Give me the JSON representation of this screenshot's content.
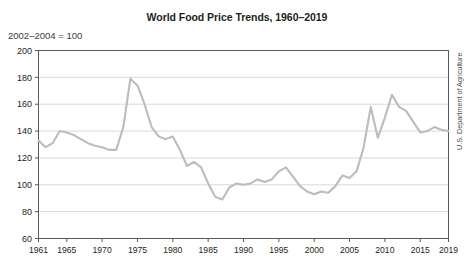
{
  "chart_data": {
    "type": "line",
    "title": "World Food Price Trends, 1960–2019",
    "subtitle": "2002–2004 = 100",
    "source": "U.S. Department of Agriculture",
    "xlabel": "",
    "ylabel": "",
    "ylim": [
      60,
      200
    ],
    "xlim": [
      1961,
      2019
    ],
    "yticks": [
      60,
      80,
      100,
      120,
      140,
      160,
      180,
      200
    ],
    "ytick_labels": [
      "60",
      "80",
      "100",
      "120",
      "140",
      "160",
      "180",
      "200"
    ],
    "xticks": [
      1961,
      1965,
      1970,
      1975,
      1980,
      1985,
      1990,
      1995,
      2000,
      2005,
      2010,
      2015,
      2019
    ],
    "xtick_labels": [
      "1961",
      "1965",
      "1970",
      "1975",
      "1980",
      "1985",
      "1990",
      "1995",
      "2000",
      "2005",
      "2010",
      "2015",
      "2019"
    ],
    "grid": true,
    "legend": false,
    "line_color": "#bcbcbc",
    "series": [
      {
        "name": "World food price index",
        "x": [
          1961,
          1962,
          1963,
          1964,
          1965,
          1966,
          1967,
          1968,
          1969,
          1970,
          1971,
          1972,
          1973,
          1974,
          1975,
          1976,
          1977,
          1978,
          1979,
          1980,
          1981,
          1982,
          1983,
          1984,
          1985,
          1986,
          1987,
          1988,
          1989,
          1990,
          1991,
          1992,
          1993,
          1994,
          1995,
          1996,
          1997,
          1998,
          1999,
          2000,
          2001,
          2002,
          2003,
          2004,
          2005,
          2006,
          2007,
          2008,
          2009,
          2010,
          2011,
          2012,
          2013,
          2014,
          2015,
          2016,
          2017,
          2018,
          2019
        ],
        "values": [
          133,
          128,
          131,
          140,
          139,
          137,
          134,
          131,
          129,
          128,
          126,
          126,
          143,
          179,
          174,
          160,
          143,
          136,
          134,
          136,
          126,
          114,
          117,
          113,
          101,
          91,
          89,
          98,
          101,
          100,
          101,
          104,
          102,
          104,
          110,
          113,
          106,
          99,
          95,
          93,
          95,
          94,
          99,
          107,
          105,
          110,
          128,
          158,
          135,
          150,
          167,
          158,
          155,
          147,
          139,
          140,
          143,
          141,
          140
        ]
      }
    ]
  },
  "chart": {
    "title": "World Food Price Trends, 1960–2019",
    "subtitle": "2002–2004 = 100",
    "source": "U.S. Department of Agriculture"
  }
}
